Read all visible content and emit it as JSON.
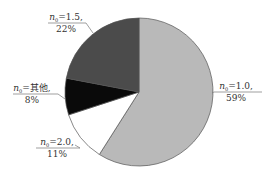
{
  "chart_data": {
    "type": "pie",
    "title": "",
    "start_angle_deg": 0,
    "direction": "clockwise",
    "slices": [
      {
        "label": "n₀=1.0",
        "var": "n",
        "sub": "0",
        "value_text": "1.0",
        "percent": 59,
        "percent_text": "59%",
        "color": "#b9b9b9"
      },
      {
        "label": "n₀=2.0",
        "var": "n",
        "sub": "0",
        "value_text": "2.0",
        "percent": 11,
        "percent_text": "11%",
        "color": "#ffffff"
      },
      {
        "label": "n₀=其他",
        "var": "n",
        "sub": "0",
        "value_text": "其他",
        "percent": 8,
        "percent_text": "8%",
        "color": "#0a0a0a"
      },
      {
        "label": "n₀=1.5",
        "var": "n",
        "sub": "0",
        "value_text": "1.5",
        "percent": 22,
        "percent_text": "22%",
        "color": "#4b4b4b"
      }
    ],
    "label_separator": ",",
    "legend": "none"
  }
}
